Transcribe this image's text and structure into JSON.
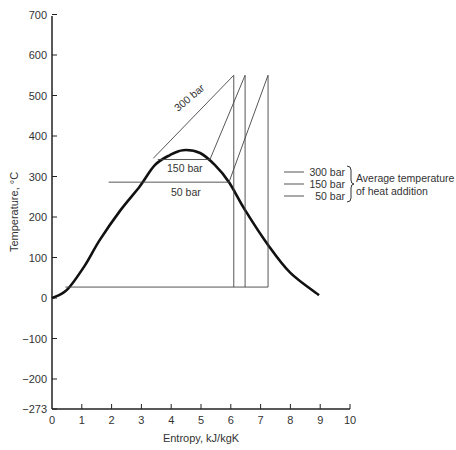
{
  "chart_data": {
    "type": "line",
    "title": "",
    "xlabel": "Entropy, kJ/kgK",
    "ylabel": "Temperature, °C",
    "xlim": [
      0,
      10
    ],
    "ylim": [
      -273,
      700
    ],
    "xticks": [
      "0",
      "1",
      "2",
      "3",
      "4",
      "5",
      "6",
      "7",
      "8",
      "9",
      "10"
    ],
    "xtick_values": [
      0,
      1,
      2,
      3,
      4,
      5,
      6,
      7,
      8,
      9,
      10
    ],
    "yticks": [
      "700",
      "600",
      "500",
      "400",
      "300",
      "200",
      "100",
      "0",
      "−100",
      "−200",
      "−273"
    ],
    "ytick_values": [
      700,
      600,
      500,
      400,
      300,
      200,
      100,
      0,
      -100,
      -200,
      -273
    ],
    "grid": false,
    "series": [
      {
        "name": "saturation dome",
        "x": [
          0,
          0.5,
          1.1,
          1.6,
          2.3,
          2.95,
          3.45,
          3.96,
          4.4,
          4.97,
          5.47,
          5.94,
          6.48,
          7.25,
          8.0,
          8.96
        ],
        "y": [
          0,
          20,
          80,
          143,
          217,
          276,
          328,
          353,
          365,
          358,
          328,
          286,
          217,
          131,
          62,
          7
        ]
      },
      {
        "name": "300 bar",
        "x": [
          3.4,
          6.1,
          6.1
        ],
        "y": [
          345,
          550,
          27
        ]
      },
      {
        "name": "150 bar",
        "x": [
          3.55,
          5.3,
          6.48,
          6.48
        ],
        "y": [
          342,
          342,
          550,
          27
        ]
      },
      {
        "name": "50 bar",
        "x": [
          1.9,
          5.94,
          7.25,
          7.25
        ],
        "y": [
          286,
          286,
          550,
          27
        ]
      },
      {
        "name": "condensation",
        "x": [
          0.45,
          7.25
        ],
        "y": [
          27,
          27
        ]
      }
    ],
    "annotations": [
      {
        "text": "300 bar",
        "x": 4.6,
        "y": 450,
        "rotated": true
      },
      {
        "text": "150 bar",
        "x": 4.4,
        "y": 320
      },
      {
        "text": "50 bar",
        "x": 4.4,
        "y": 260
      }
    ],
    "legend": {
      "placement": "right",
      "entries": [
        "300 bar",
        "150 bar",
        "50 bar"
      ],
      "group_label_line1": "Average temperature",
      "group_label_line2": "of heat addition"
    }
  }
}
